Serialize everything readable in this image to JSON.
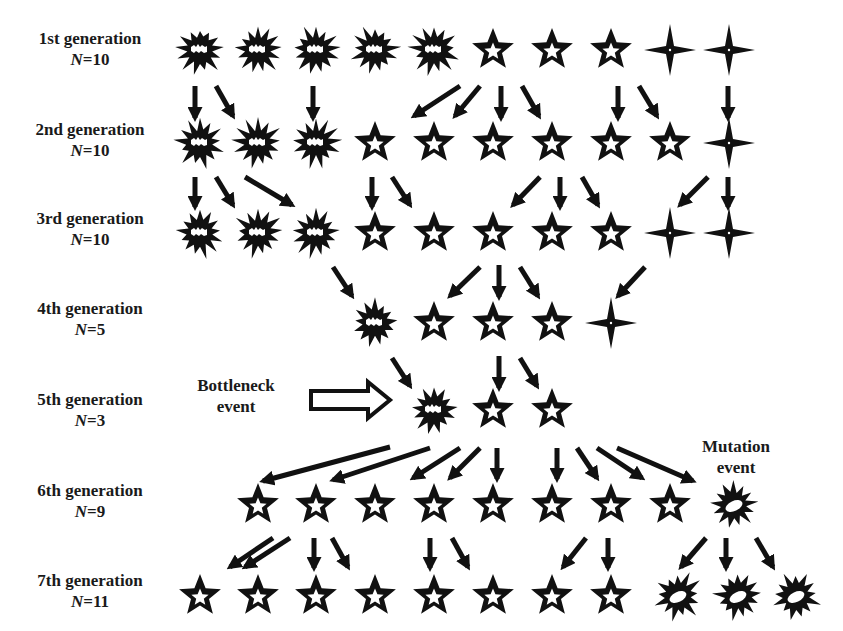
{
  "diagram": {
    "colors": {
      "shape": "#111111",
      "background": "#ffffff"
    },
    "generations": [
      {
        "label": "1st generation",
        "n_var": "N",
        "n_value": "=10",
        "y": 50,
        "individuals": [
          {
            "type": "burst",
            "x": 200
          },
          {
            "type": "burst",
            "x": 258
          },
          {
            "type": "burst",
            "x": 316
          },
          {
            "type": "burst",
            "x": 375
          },
          {
            "type": "burst",
            "x": 434
          },
          {
            "type": "star",
            "x": 493
          },
          {
            "type": "star",
            "x": 552
          },
          {
            "type": "star",
            "x": 611
          },
          {
            "type": "sparkle",
            "x": 670
          },
          {
            "type": "sparkle",
            "x": 729
          }
        ]
      },
      {
        "label": "2nd generation",
        "n_var": "N",
        "n_value": "=10",
        "y": 143,
        "individuals": [
          {
            "type": "burst",
            "x": 200
          },
          {
            "type": "burst",
            "x": 258
          },
          {
            "type": "burst",
            "x": 316
          },
          {
            "type": "star",
            "x": 375
          },
          {
            "type": "star",
            "x": 434
          },
          {
            "type": "star",
            "x": 493
          },
          {
            "type": "star",
            "x": 552
          },
          {
            "type": "star",
            "x": 611
          },
          {
            "type": "star",
            "x": 670
          },
          {
            "type": "sparkle",
            "x": 729
          }
        ]
      },
      {
        "label": "3rd generation",
        "n_var": "N",
        "n_value": "=10",
        "y": 233,
        "individuals": [
          {
            "type": "burst",
            "x": 200
          },
          {
            "type": "burst",
            "x": 258
          },
          {
            "type": "burst",
            "x": 316
          },
          {
            "type": "star",
            "x": 375
          },
          {
            "type": "star",
            "x": 434
          },
          {
            "type": "star",
            "x": 493
          },
          {
            "type": "star",
            "x": 552
          },
          {
            "type": "star",
            "x": 611
          },
          {
            "type": "sparkle",
            "x": 670
          },
          {
            "type": "sparkle",
            "x": 729
          }
        ]
      },
      {
        "label": "4th generation",
        "n_var": "N",
        "n_value": "=5",
        "y": 323,
        "individuals": [
          {
            "type": "burst",
            "x": 375
          },
          {
            "type": "star",
            "x": 434
          },
          {
            "type": "star",
            "x": 493
          },
          {
            "type": "star",
            "x": 552
          },
          {
            "type": "sparkle",
            "x": 611
          }
        ]
      },
      {
        "label": "5th generation",
        "n_var": "N",
        "n_value": "=3",
        "y": 410,
        "individuals": [
          {
            "type": "burst",
            "x": 434
          },
          {
            "type": "star",
            "x": 493
          },
          {
            "type": "star",
            "x": 552
          }
        ]
      },
      {
        "label": "6th generation",
        "n_var": "N",
        "n_value": "=9",
        "y": 505,
        "individuals": [
          {
            "type": "star",
            "x": 258
          },
          {
            "type": "star",
            "x": 316
          },
          {
            "type": "star",
            "x": 375
          },
          {
            "type": "star",
            "x": 434
          },
          {
            "type": "star",
            "x": 493
          },
          {
            "type": "star",
            "x": 552
          },
          {
            "type": "star",
            "x": 611
          },
          {
            "type": "star",
            "x": 670
          },
          {
            "type": "mutant",
            "x": 734
          }
        ]
      },
      {
        "label": "7th generation",
        "n_var": "N",
        "n_value": "=11",
        "y": 596,
        "individuals": [
          {
            "type": "star",
            "x": 200
          },
          {
            "type": "star",
            "x": 258
          },
          {
            "type": "star",
            "x": 316
          },
          {
            "type": "star",
            "x": 375
          },
          {
            "type": "star",
            "x": 434
          },
          {
            "type": "star",
            "x": 493
          },
          {
            "type": "star",
            "x": 552
          },
          {
            "type": "star",
            "x": 611
          },
          {
            "type": "mutant",
            "x": 678
          },
          {
            "type": "mutant",
            "x": 738
          },
          {
            "type": "mutant",
            "x": 796
          }
        ]
      }
    ],
    "arrows": [
      [
        195,
        86,
        195,
        118
      ],
      [
        216,
        86,
        233,
        116
      ],
      [
        313,
        86,
        313,
        118
      ],
      [
        460,
        86,
        414,
        116
      ],
      [
        480,
        86,
        455,
        116
      ],
      [
        501,
        86,
        501,
        118
      ],
      [
        522,
        86,
        539,
        116
      ],
      [
        618,
        86,
        618,
        118
      ],
      [
        639,
        86,
        657,
        116
      ],
      [
        728,
        86,
        728,
        118
      ],
      [
        195,
        177,
        195,
        207
      ],
      [
        216,
        177,
        233,
        205
      ],
      [
        245,
        177,
        292,
        205
      ],
      [
        372,
        177,
        372,
        207
      ],
      [
        392,
        177,
        410,
        205
      ],
      [
        540,
        177,
        513,
        205
      ],
      [
        560,
        177,
        560,
        207
      ],
      [
        582,
        177,
        598,
        205
      ],
      [
        708,
        177,
        680,
        205
      ],
      [
        728,
        177,
        728,
        207
      ],
      [
        333,
        267,
        352,
        296
      ],
      [
        480,
        267,
        450,
        296
      ],
      [
        499,
        265,
        499,
        297
      ],
      [
        520,
        267,
        538,
        296
      ],
      [
        645,
        267,
        618,
        296
      ],
      [
        392,
        358,
        410,
        386
      ],
      [
        499,
        356,
        499,
        388
      ],
      [
        520,
        358,
        537,
        386
      ],
      [
        390,
        447,
        263,
        481
      ],
      [
        430,
        448,
        333,
        480
      ],
      [
        460,
        448,
        413,
        478
      ],
      [
        480,
        448,
        450,
        478
      ],
      [
        497,
        448,
        497,
        479
      ],
      [
        557,
        448,
        557,
        479
      ],
      [
        577,
        448,
        597,
        478
      ],
      [
        597,
        448,
        642,
        478
      ],
      [
        617,
        448,
        693,
        481
      ],
      [
        273,
        538,
        230,
        567
      ],
      [
        290,
        538,
        245,
        567
      ],
      [
        314,
        538,
        314,
        568
      ],
      [
        332,
        538,
        348,
        567
      ],
      [
        430,
        538,
        430,
        568
      ],
      [
        452,
        538,
        468,
        567
      ],
      [
        586,
        538,
        563,
        567
      ],
      [
        608,
        538,
        608,
        568
      ],
      [
        706,
        538,
        681,
        567
      ],
      [
        726,
        538,
        726,
        568
      ],
      [
        756,
        538,
        773,
        567
      ]
    ],
    "bottleneck": {
      "label_line1": "Bottleneck",
      "label_line2": "event",
      "arrow": {
        "x1": 311,
        "x2": 390,
        "y": 400
      }
    },
    "mutation": {
      "label_line1": "Mutation",
      "label_line2": "event"
    }
  }
}
